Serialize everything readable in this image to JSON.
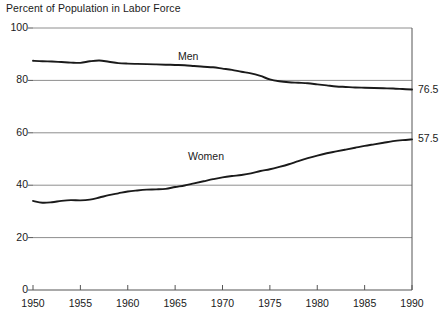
{
  "chart_data": {
    "type": "line",
    "title": "Percent of Population in Labor Force",
    "xlabel": "",
    "ylabel": "",
    "xlim": [
      1950,
      1990
    ],
    "ylim": [
      0,
      100
    ],
    "grid": true,
    "legend_position": "inline-annotation",
    "yticks": [
      0,
      20,
      40,
      60,
      80,
      100
    ],
    "ytick_labels": [
      "0",
      "20",
      "40",
      "60",
      "80",
      "100"
    ],
    "xticks": [
      1950,
      1955,
      1960,
      1965,
      1970,
      1975,
      1980,
      1985,
      1990
    ],
    "xtick_labels": [
      "1950",
      "1955",
      "1960",
      "1965",
      "1970",
      "1975",
      "1980",
      "1985",
      "1990"
    ],
    "x": [
      1950,
      1951,
      1952,
      1953,
      1954,
      1955,
      1956,
      1957,
      1958,
      1959,
      1960,
      1961,
      1962,
      1963,
      1964,
      1965,
      1966,
      1967,
      1968,
      1969,
      1970,
      1971,
      1972,
      1973,
      1974,
      1975,
      1976,
      1977,
      1978,
      1979,
      1980,
      1981,
      1982,
      1983,
      1984,
      1985,
      1986,
      1987,
      1988,
      1989,
      1990
    ],
    "series": [
      {
        "name": "Men",
        "color": "#1a1a1a",
        "end_value": 76.5,
        "end_label": "76.5",
        "annotation": "Men",
        "values": [
          87.5,
          87.3,
          87.2,
          87.0,
          86.8,
          86.7,
          87.3,
          87.6,
          87.1,
          86.6,
          86.4,
          86.3,
          86.2,
          86.1,
          86.0,
          85.9,
          85.8,
          85.5,
          85.2,
          85.0,
          84.5,
          84.0,
          83.3,
          82.7,
          81.7,
          80.4,
          79.7,
          79.3,
          79.1,
          78.9,
          78.5,
          78.1,
          77.7,
          77.5,
          77.3,
          77.2,
          77.1,
          77.0,
          76.9,
          76.7,
          76.5
        ]
      },
      {
        "name": "Women",
        "color": "#1a1a1a",
        "end_value": 57.5,
        "end_label": "57.5",
        "annotation": "Women",
        "values": [
          34.0,
          33.3,
          33.5,
          34.0,
          34.3,
          34.2,
          34.5,
          35.3,
          36.2,
          36.9,
          37.6,
          38.0,
          38.3,
          38.4,
          38.6,
          39.3,
          39.9,
          40.7,
          41.5,
          42.3,
          43.0,
          43.5,
          43.9,
          44.5,
          45.4,
          46.1,
          47.0,
          48.0,
          49.2,
          50.3,
          51.3,
          52.2,
          52.9,
          53.6,
          54.3,
          55.0,
          55.6,
          56.2,
          56.8,
          57.2,
          57.5
        ]
      }
    ]
  }
}
